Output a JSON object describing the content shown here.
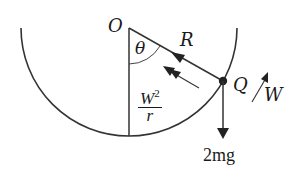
{
  "diagram": {
    "type": "physics-free-body",
    "labels": {
      "center": "O",
      "angle": "θ",
      "radius_force": "R",
      "particle": "Q",
      "velocity": "W",
      "centripetal_num": "W",
      "centripetal_exp": "2",
      "centripetal_den": "r",
      "weight": "2mg"
    },
    "colors": {
      "stroke": "#333333",
      "text": "#1a1a1a",
      "background": "#ffffff"
    }
  }
}
